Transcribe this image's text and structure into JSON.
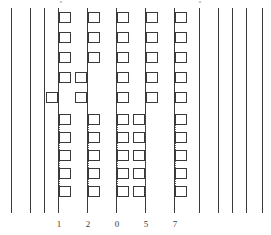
{
  "figure": {
    "title": "",
    "width": 271,
    "height": 235,
    "background": "#ffffff",
    "line_color": "#3a3a3a",
    "cell_border_color": "#3a3a3a",
    "cell_fill_color": "#ffffff",
    "dotted_color": "#555555",
    "label_color": "#3c3c3c"
  },
  "strands": [
    {
      "id": "strand-1",
      "x": 11,
      "top": 8,
      "height": 205,
      "has_cells": false,
      "label": ""
    },
    {
      "id": "strand-2",
      "x": 30,
      "top": 8,
      "height": 205,
      "has_cells": false,
      "label": ""
    },
    {
      "id": "strand-3",
      "x": 44,
      "top": 8,
      "height": 205,
      "has_cells": false,
      "label": ""
    },
    {
      "id": "strand-4",
      "x": 58,
      "top": 8,
      "height": 205,
      "has_cells": true,
      "label": "1"
    },
    {
      "id": "strand-5",
      "x": 87,
      "top": 8,
      "height": 205,
      "has_cells": true,
      "label": "2"
    },
    {
      "id": "strand-6",
      "x": 116,
      "top": 8,
      "height": 205,
      "has_cells": true,
      "label": "0"
    },
    {
      "id": "strand-7",
      "x": 145,
      "top": 8,
      "height": 205,
      "has_cells": true,
      "label": "5"
    },
    {
      "id": "strand-8",
      "x": 174,
      "top": 8,
      "height": 205,
      "has_cells": true,
      "label": "7"
    },
    {
      "id": "strand-9",
      "x": 199,
      "top": 8,
      "height": 205,
      "has_cells": false,
      "label": ""
    },
    {
      "id": "strand-10",
      "x": 218,
      "top": 8,
      "height": 205,
      "has_cells": false,
      "label": ""
    },
    {
      "id": "strand-11",
      "x": 232,
      "top": 8,
      "height": 205,
      "has_cells": false,
      "label": ""
    },
    {
      "id": "strand-12",
      "x": 246,
      "top": 8,
      "height": 205,
      "has_cells": false,
      "label": ""
    },
    {
      "id": "strand-13",
      "x": 262,
      "top": 8,
      "height": 205,
      "has_cells": false,
      "label": ""
    }
  ],
  "cells": [
    {
      "strand": "strand-4",
      "side": "right",
      "x": 59,
      "y": 12
    },
    {
      "strand": "strand-4",
      "side": "right",
      "x": 59,
      "y": 32
    },
    {
      "strand": "strand-4",
      "side": "right",
      "x": 59,
      "y": 52
    },
    {
      "strand": "strand-4",
      "side": "right",
      "x": 59,
      "y": 72
    },
    {
      "strand": "strand-4",
      "side": "left",
      "x": 46,
      "y": 92
    },
    {
      "strand": "strand-4",
      "side": "right",
      "x": 59,
      "y": 114
    },
    {
      "strand": "strand-4",
      "side": "right",
      "x": 59,
      "y": 132
    },
    {
      "strand": "strand-4",
      "side": "right",
      "x": 59,
      "y": 150
    },
    {
      "strand": "strand-4",
      "side": "right",
      "x": 59,
      "y": 168
    },
    {
      "strand": "strand-4",
      "side": "right",
      "x": 59,
      "y": 186
    },
    {
      "strand": "strand-5",
      "side": "right",
      "x": 88,
      "y": 12
    },
    {
      "strand": "strand-5",
      "side": "right",
      "x": 88,
      "y": 32
    },
    {
      "strand": "strand-5",
      "side": "right",
      "x": 88,
      "y": 52
    },
    {
      "strand": "strand-5",
      "side": "left",
      "x": 75,
      "y": 72
    },
    {
      "strand": "strand-5",
      "side": "left",
      "x": 75,
      "y": 92
    },
    {
      "strand": "strand-5",
      "side": "right",
      "x": 88,
      "y": 114
    },
    {
      "strand": "strand-5",
      "side": "right",
      "x": 88,
      "y": 132
    },
    {
      "strand": "strand-5",
      "side": "right",
      "x": 88,
      "y": 150
    },
    {
      "strand": "strand-5",
      "side": "right",
      "x": 88,
      "y": 168
    },
    {
      "strand": "strand-5",
      "side": "right",
      "x": 88,
      "y": 186
    },
    {
      "strand": "strand-6",
      "side": "right",
      "x": 117,
      "y": 12
    },
    {
      "strand": "strand-6",
      "side": "right",
      "x": 117,
      "y": 32
    },
    {
      "strand": "strand-6",
      "side": "right",
      "x": 117,
      "y": 52
    },
    {
      "strand": "strand-6",
      "side": "right",
      "x": 117,
      "y": 72
    },
    {
      "strand": "strand-6",
      "side": "right",
      "x": 117,
      "y": 92
    },
    {
      "strand": "strand-6",
      "side": "right",
      "x": 117,
      "y": 114
    },
    {
      "strand": "strand-6",
      "side": "right",
      "x": 117,
      "y": 132
    },
    {
      "strand": "strand-6",
      "side": "right",
      "x": 117,
      "y": 150
    },
    {
      "strand": "strand-6",
      "side": "right",
      "x": 117,
      "y": 168
    },
    {
      "strand": "strand-6",
      "side": "right",
      "x": 117,
      "y": 186
    },
    {
      "strand": "strand-7",
      "side": "right",
      "x": 146,
      "y": 12
    },
    {
      "strand": "strand-7",
      "side": "right",
      "x": 146,
      "y": 32
    },
    {
      "strand": "strand-7",
      "side": "right",
      "x": 146,
      "y": 52
    },
    {
      "strand": "strand-7",
      "side": "right",
      "x": 146,
      "y": 72
    },
    {
      "strand": "strand-7",
      "side": "right",
      "x": 146,
      "y": 92
    },
    {
      "strand": "strand-7",
      "side": "left",
      "x": 133,
      "y": 114
    },
    {
      "strand": "strand-7",
      "side": "left",
      "x": 133,
      "y": 132
    },
    {
      "strand": "strand-7",
      "side": "left",
      "x": 133,
      "y": 150
    },
    {
      "strand": "strand-7",
      "side": "left",
      "x": 133,
      "y": 168
    },
    {
      "strand": "strand-7",
      "side": "left",
      "x": 133,
      "y": 186
    },
    {
      "strand": "strand-8",
      "side": "right",
      "x": 175,
      "y": 12
    },
    {
      "strand": "strand-8",
      "side": "right",
      "x": 175,
      "y": 32
    },
    {
      "strand": "strand-8",
      "side": "right",
      "x": 175,
      "y": 52
    },
    {
      "strand": "strand-8",
      "side": "right",
      "x": 175,
      "y": 72
    },
    {
      "strand": "strand-8",
      "side": "right",
      "x": 175,
      "y": 92
    },
    {
      "strand": "strand-8",
      "side": "right",
      "x": 175,
      "y": 114
    },
    {
      "strand": "strand-8",
      "side": "right",
      "x": 175,
      "y": 132
    },
    {
      "strand": "strand-8",
      "side": "right",
      "x": 175,
      "y": 150
    },
    {
      "strand": "strand-8",
      "side": "right",
      "x": 175,
      "y": 168
    },
    {
      "strand": "strand-8",
      "side": "right",
      "x": 175,
      "y": 186
    }
  ],
  "dotted_runs": [
    {
      "strand": "strand-4",
      "x": 59,
      "y": 114,
      "height": 80
    },
    {
      "strand": "strand-5",
      "x": 88,
      "y": 114,
      "height": 80
    },
    {
      "strand": "strand-6",
      "x": 117,
      "y": 114,
      "height": 80
    },
    {
      "strand": "strand-7",
      "x": 145,
      "y": 114,
      "height": 80
    },
    {
      "strand": "strand-8",
      "x": 175,
      "y": 114,
      "height": 80
    }
  ],
  "tick_labels": [
    {
      "text": "1",
      "x": 52,
      "y": 219
    },
    {
      "text": "2",
      "x": 81,
      "y": 219
    },
    {
      "text": "0",
      "x": 110,
      "y": 219
    },
    {
      "text": "5",
      "x": 139,
      "y": 219
    },
    {
      "text": "7",
      "x": 168,
      "y": 219
    }
  ],
  "top_glyphs": [
    {
      "text": "•",
      "x": 54,
      "y": 0
    },
    {
      "text": "•",
      "x": 193,
      "y": 0
    }
  ]
}
